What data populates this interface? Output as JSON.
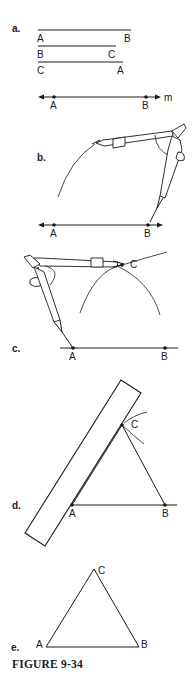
{
  "figure": {
    "caption": "FIGURE 9-34",
    "topic": "Construction of an equilateral triangle with compass and straightedge"
  },
  "parts": {
    "a": {
      "label": "a.",
      "segments": [
        {
          "left": "A",
          "right": "B"
        },
        {
          "left": "B",
          "right": "C"
        },
        {
          "left": "C",
          "right": "A"
        }
      ],
      "line": {
        "name": "m",
        "points": [
          "A",
          "B"
        ]
      }
    },
    "b": {
      "label": "b.",
      "points": [
        "A",
        "B"
      ]
    },
    "c": {
      "label": "c.",
      "points": [
        "A",
        "B",
        "C"
      ]
    },
    "d": {
      "label": "d.",
      "points": [
        "A",
        "B",
        "C"
      ]
    },
    "e": {
      "label": "e.",
      "points": [
        "A",
        "B",
        "C"
      ]
    }
  }
}
